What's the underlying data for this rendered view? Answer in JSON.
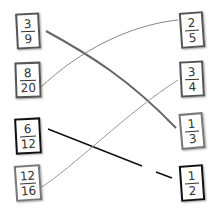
{
  "left_cards": [
    {
      "numerator": "3",
      "denominator": "9"
    },
    {
      "numerator": "8",
      "denominator": "20"
    },
    {
      "numerator": "6",
      "denominator": "12"
    },
    {
      "numerator": "12",
      "denominator": "16"
    }
  ],
  "right_cards": [
    {
      "numerator": "2",
      "denominator": "5"
    },
    {
      "numerator": "3",
      "denominator": "4"
    },
    {
      "numerator": "1",
      "denominator": "3"
    },
    {
      "numerator": "1",
      "denominator": "2"
    }
  ],
  "connections": [
    {
      "from": "3/9",
      "to": "1/3",
      "color": "#666666"
    },
    {
      "from": "8/20",
      "to": "2/5",
      "color": "#888888"
    },
    {
      "from": "6/12",
      "to": "1/2",
      "color": "#111111"
    },
    {
      "from": "12/16",
      "to": "3/4",
      "color": "#999999"
    }
  ]
}
